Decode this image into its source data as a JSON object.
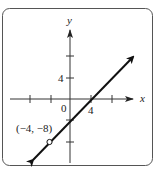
{
  "graph": {
    "axis_labels": {
      "x": "x",
      "y": "y"
    },
    "origin_label": "0",
    "x_tick_label": "4",
    "y_tick_label": "4",
    "point_label": "(−4, −8)",
    "line": {
      "slope": 1,
      "y_intercept": -4,
      "description": "line through (−4, −8) with arrows at both ends"
    },
    "point": {
      "x": -4,
      "y": -8,
      "style": "open circle"
    },
    "x_ticks": [
      -8,
      -4,
      4,
      8
    ],
    "y_ticks": [
      -8,
      -4,
      4,
      8
    ],
    "colors": {
      "frame": "#555555",
      "axis": "#333333",
      "line": "#111111"
    }
  }
}
